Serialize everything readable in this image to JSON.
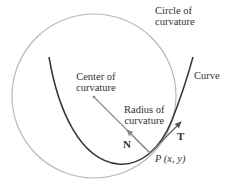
{
  "diagram": {
    "labels": {
      "circle": [
        "Circle of",
        "curvature"
      ],
      "curve": "Curve",
      "center": [
        "Center of",
        "curvature"
      ],
      "radius": [
        "Radius of",
        "curvature"
      ],
      "normal": "N",
      "tangent": "T",
      "point": "P (x, y)"
    },
    "colors": {
      "curve": "#333333",
      "circle": "#b5b5b5",
      "radius": "#8a8a8a",
      "text": "#333333"
    },
    "geometry": {
      "circle_center": [
        94,
        96
      ],
      "circle_radius": 82,
      "point_P": [
        150,
        153
      ],
      "tangent_tip": [
        181,
        122
      ],
      "normal_tip": [
        126,
        129
      ]
    }
  }
}
